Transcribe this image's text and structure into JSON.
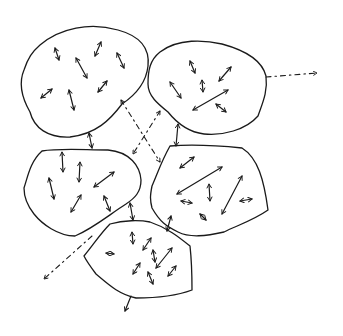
{
  "diagram": {
    "stroke_color": "#1a1a1a",
    "background": "#ffffff",
    "regions": [
      {
        "id": "top-left",
        "label": ""
      },
      {
        "id": "top-right",
        "label": ""
      },
      {
        "id": "middle-left",
        "label": ""
      },
      {
        "id": "middle-right",
        "label": ""
      },
      {
        "id": "bottom-center",
        "label": ""
      }
    ],
    "connections": [
      {
        "from": "top-left",
        "to": "middle-left",
        "style": "solid-double-arrow"
      },
      {
        "from": "top-right",
        "to": "middle-right",
        "style": "solid-double-arrow"
      },
      {
        "from": "middle-left",
        "to": "bottom-center",
        "style": "solid-double-arrow"
      },
      {
        "from": "middle-right",
        "to": "bottom-center",
        "style": "solid-double-arrow"
      },
      {
        "from": "top-left",
        "to": "middle-right",
        "style": "dashed-arrow"
      },
      {
        "from": "top-right",
        "to": "middle-left",
        "style": "dashed-arrow"
      },
      {
        "from": "top-right",
        "to": "outside-right",
        "style": "dashed-arrow"
      },
      {
        "from": "bottom-center",
        "to": "outside-bottom-left",
        "style": "dashed-arrow"
      },
      {
        "from": "bottom-center",
        "to": "outside-bottom",
        "style": "solid-arrow"
      }
    ]
  }
}
